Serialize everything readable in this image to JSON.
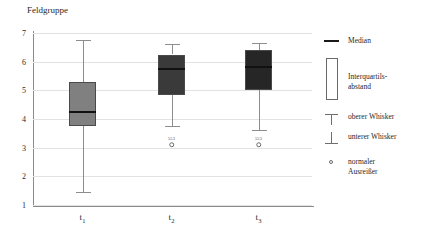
{
  "chart_data": {
    "type": "box",
    "title": "Feldgruppe",
    "xlabel": "",
    "ylabel": "",
    "ylim": [
      1,
      7
    ],
    "yticks": [
      1,
      2,
      3,
      4,
      5,
      6,
      7
    ],
    "ytick_labels": [
      "1",
      "2",
      "3",
      "4",
      "5",
      "6",
      "7"
    ],
    "grid": true,
    "categories": [
      "t1",
      "t2",
      "t3"
    ],
    "category_labels": [
      "t",
      "t",
      "t"
    ],
    "category_subscripts": [
      "1",
      "2",
      "3"
    ],
    "legend_position": "right",
    "boxes": [
      {
        "category": "t1",
        "whisker_high": 6.75,
        "q3": 5.3,
        "median": 4.25,
        "q1": 3.75,
        "whisker_low": 1.45,
        "fill_color": "#808080",
        "outliers": []
      },
      {
        "category": "t2",
        "whisker_high": 6.6,
        "q3": 6.25,
        "median": 5.75,
        "q1": 4.85,
        "whisker_low": 3.75,
        "fill_color": "#3a3a3a",
        "outliers": [
          {
            "value": 3.1,
            "label": "553"
          }
        ]
      },
      {
        "category": "t3",
        "whisker_high": 6.65,
        "q3": 6.4,
        "median": 5.8,
        "q1": 5.0,
        "whisker_low": 3.6,
        "fill_color": "#262626",
        "outliers": [
          {
            "value": 3.1,
            "label": "553"
          }
        ]
      }
    ],
    "legend": [
      {
        "key": "median",
        "label": "Median",
        "symbol": "median-line-icon"
      },
      {
        "key": "iqr",
        "label": "Interquartils-\nabstand",
        "symbol": "iqr-box-icon"
      },
      {
        "key": "upper_whisker",
        "label": "oberer Whisker",
        "symbol": "upper-whisker-icon"
      },
      {
        "key": "lower_whisker",
        "label": "unterer Whisker",
        "symbol": "lower-whisker-icon"
      },
      {
        "key": "outlier",
        "label": "normaler\nAusreißer",
        "symbol": "outlier-circle-icon"
      }
    ],
    "colors": {
      "axis": "#8a8a8a",
      "grid": "#e2e2e2",
      "median": "#111111",
      "whisker": "#8d8d8d",
      "text": "#1a1a1a"
    }
  }
}
